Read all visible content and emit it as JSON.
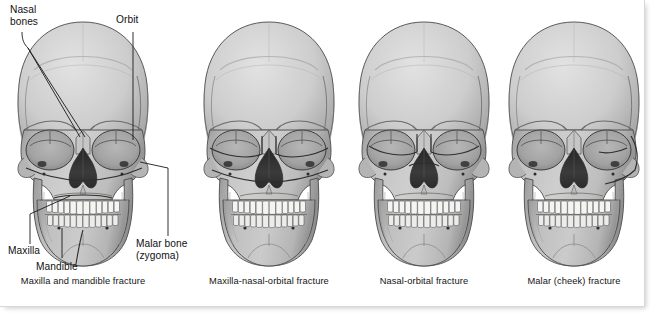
{
  "figure": {
    "background_color": "#ffffff",
    "plate_border_color": "#d8d8d8",
    "bone_color": "#b9b9b9",
    "bone_light_color": "#d5d5d5",
    "bone_shadow_color": "#8f8f8f",
    "tooth_color": "#f4f4f2",
    "cavity_color": "#3a3a3a",
    "outline_color": "#3c3c3c",
    "text_color": "#111111"
  },
  "labels": [
    {
      "id": "nasal-bones",
      "text": "Nasal\nbones"
    },
    {
      "id": "orbit",
      "text": "Orbit"
    },
    {
      "id": "maxilla",
      "text": "Maxilla"
    },
    {
      "id": "mandible",
      "text": "Mandible"
    },
    {
      "id": "malar",
      "text": "Malar bone\n(zygoma)"
    }
  ],
  "panels": [
    {
      "index": 1,
      "caption": "Maxilla and mandible\nfracture",
      "fracture_regions": [
        "maxilla",
        "mandible"
      ],
      "annotated": true
    },
    {
      "index": 2,
      "caption": "Maxilla-nasal-orbital\nfracture",
      "fracture_regions": [
        "maxilla",
        "nasal",
        "orbital"
      ],
      "annotated": false
    },
    {
      "index": 3,
      "caption": "Nasal-orbital fracture",
      "fracture_regions": [
        "nasal",
        "orbital"
      ],
      "annotated": false
    },
    {
      "index": 4,
      "caption": "Malar (cheek) fracture",
      "fracture_regions": [
        "malar",
        "zygoma"
      ],
      "annotated": false
    }
  ],
  "skull_anatomy": {
    "parts": [
      "cranium",
      "frontal-bone",
      "orbit-left",
      "orbit-right",
      "nasal-aperture",
      "zygomatic-arch-left",
      "zygomatic-arch-right",
      "maxilla",
      "mandible",
      "upper-teeth",
      "lower-teeth",
      "mental-foramen-left",
      "mental-foramen-right"
    ],
    "upper_teeth_count": 16,
    "lower_teeth_count": 16
  }
}
